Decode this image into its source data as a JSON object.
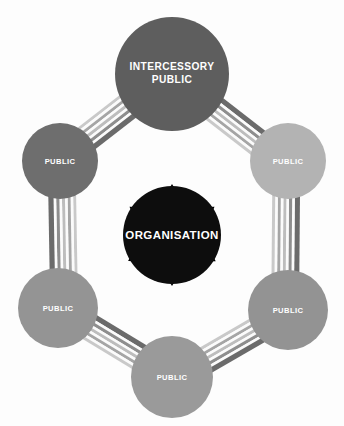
{
  "diagram": {
    "background_color": "#fdfdfd",
    "center": {
      "id": "organisation",
      "label": "ORGANISATION",
      "color": "#0d0d0d",
      "text_color": "#ffffff",
      "cx": 172,
      "cy": 235,
      "r": 49
    },
    "nodes": [
      {
        "id": "intercessory-public",
        "label_line1": "INTERCESSORY",
        "label_line2": "PUBLIC",
        "label": "INTERCESSORY PUBLIC",
        "color": "#5e5e5e",
        "text_color": "#ffffff",
        "cx": 172,
        "cy": 74,
        "r": 57,
        "position": "top"
      },
      {
        "id": "public-upper-left",
        "label": "PUBLIC",
        "color": "#6e6e6e",
        "text_color": "#ffffff",
        "cx": 60,
        "cy": 161,
        "r": 38,
        "position": "upper-left"
      },
      {
        "id": "public-upper-right",
        "label": "PUBLIC",
        "color": "#b3b3b3",
        "text_color": "#ffffff",
        "cx": 288,
        "cy": 161,
        "r": 38,
        "position": "upper-right"
      },
      {
        "id": "public-lower-left",
        "label": "PUBLIC",
        "color": "#949494",
        "text_color": "#ffffff",
        "cx": 58,
        "cy": 308,
        "r": 40,
        "position": "lower-left"
      },
      {
        "id": "public-lower-right",
        "label": "PUBLIC",
        "color": "#939393",
        "text_color": "#ffffff",
        "cx": 288,
        "cy": 310,
        "r": 40,
        "position": "lower-right"
      },
      {
        "id": "public-bottom",
        "label": "PUBLIC",
        "color": "#9a9a9a",
        "text_color": "#ffffff",
        "cx": 172,
        "cy": 377,
        "r": 41,
        "position": "bottom"
      }
    ],
    "arrows": {
      "style": "double-headed",
      "color": "#000000",
      "count": 6,
      "description": "Black double-headed arrows connect the central organisation to each surrounding public"
    },
    "ring_bands": {
      "description": "Striped multi-line bands connect adjacent publics around the hexagonal ring",
      "stripe_colors": [
        "#c9c9c9",
        "#fbfbfb",
        "#a5a5a5",
        "#fbfbfb",
        "#bdbdbd",
        "#fbfbfb",
        "#8e8e8e",
        "#6b6b6b"
      ],
      "segments": [
        {
          "from": "public-upper-left",
          "to": "intercessory-public"
        },
        {
          "from": "intercessory-public",
          "to": "public-upper-right"
        },
        {
          "from": "public-upper-right",
          "to": "public-lower-right"
        },
        {
          "from": "public-lower-right",
          "to": "public-bottom"
        },
        {
          "from": "public-bottom",
          "to": "public-lower-left"
        },
        {
          "from": "public-lower-left",
          "to": "public-upper-left"
        }
      ]
    }
  }
}
